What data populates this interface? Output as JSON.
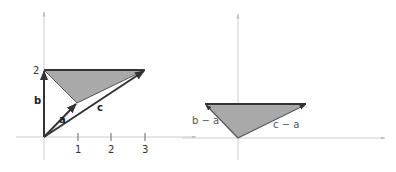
{
  "figure": {
    "left": {
      "axis": {
        "x_ticks": [
          "1",
          "2",
          "3"
        ],
        "y_tick": "2"
      },
      "vectors": [
        {
          "name": "a",
          "label": "a",
          "x": 1,
          "y": 1
        },
        {
          "name": "b",
          "label": "b",
          "x": 0,
          "y": 2
        },
        {
          "name": "c",
          "label": "c",
          "x": 3,
          "y": 2
        }
      ],
      "triangle": [
        [
          1,
          1
        ],
        [
          0,
          2
        ],
        [
          3,
          2
        ]
      ],
      "fill": "#a9a9a9"
    },
    "right": {
      "vectors": [
        {
          "name": "b-a",
          "label": "b − a",
          "x": -1,
          "y": 1
        },
        {
          "name": "c-a",
          "label": "c − a",
          "x": 2,
          "y": 1
        }
      ],
      "triangle": [
        [
          0,
          0
        ],
        [
          -1,
          1
        ],
        [
          2,
          1
        ]
      ],
      "fill": "#a9a9a9"
    }
  }
}
